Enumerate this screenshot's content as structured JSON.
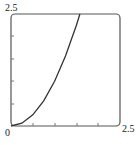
{
  "chart_data": {
    "type": "line",
    "title": "",
    "xlabel": "",
    "ylabel": "",
    "xlim": [
      0,
      2.5
    ],
    "ylim": [
      0,
      2.5
    ],
    "x_tick_labels": [
      "0",
      "2.5"
    ],
    "y_tick_labels": [
      "2.5"
    ],
    "grid": false,
    "series": [
      {
        "name": "y = x^2",
        "x": [
          0,
          0.25,
          0.5,
          0.75,
          1.0,
          1.25,
          1.5,
          1.58
        ],
        "y": [
          0,
          0.0625,
          0.25,
          0.5625,
          1.0,
          1.5625,
          2.25,
          2.5
        ]
      }
    ]
  },
  "labels": {
    "origin": "0",
    "x_max": "2.5",
    "y_max": "2.5"
  }
}
